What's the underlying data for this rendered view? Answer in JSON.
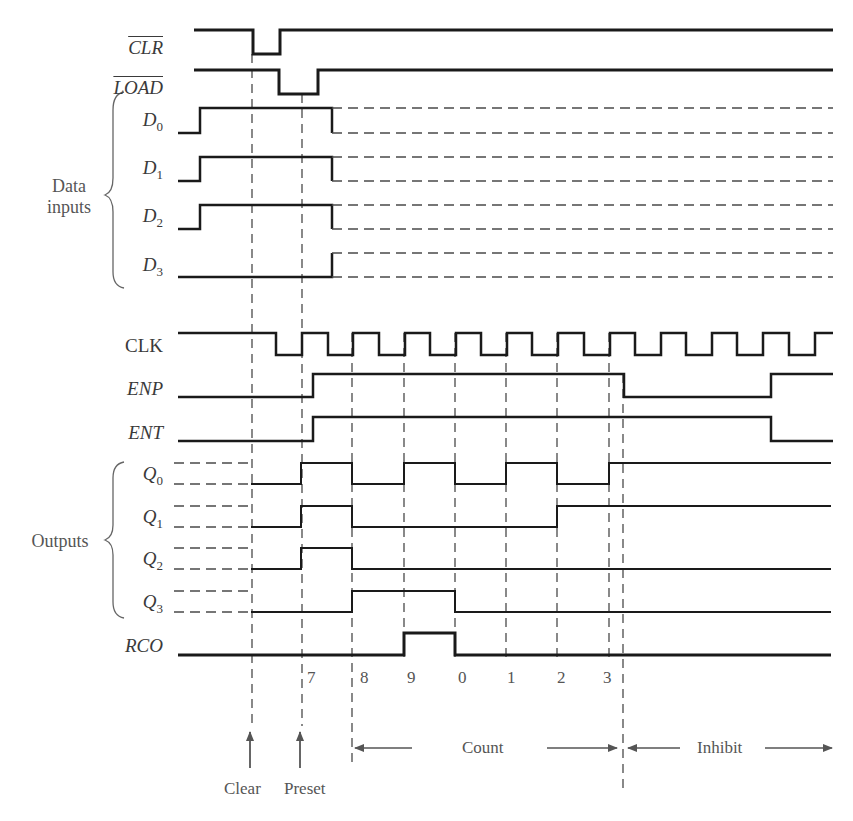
{
  "figure": {
    "type": "timing-diagram"
  },
  "groups": {
    "data_inputs": {
      "line1": "Data",
      "line2": "inputs"
    },
    "outputs": {
      "label": "Outputs"
    }
  },
  "signals": [
    {
      "id": "clr",
      "name": "CLR",
      "overline": true,
      "italic": true,
      "sub": "",
      "hi": 30,
      "lo": 54,
      "solid": [
        [
          194,
          "H"
        ],
        [
          253,
          "L"
        ],
        [
          280,
          "H"
        ],
        [
          833,
          "H"
        ]
      ],
      "dashed_after": null,
      "width": 3
    },
    {
      "id": "load",
      "name": "LOAD",
      "overline": true,
      "italic": true,
      "sub": "",
      "hi": 70,
      "lo": 94,
      "solid": [
        [
          194,
          "H"
        ],
        [
          279,
          "L"
        ],
        [
          318,
          "H"
        ],
        [
          833,
          "H"
        ]
      ],
      "dashed_after": null,
      "width": 3
    },
    {
      "id": "d0",
      "name": "D",
      "overline": false,
      "italic": true,
      "sub": "0",
      "hi": 108,
      "lo": 133,
      "solid": [
        [
          178,
          "L"
        ],
        [
          200,
          "H"
        ],
        [
          332,
          "L"
        ]
      ],
      "dashed_after": 332,
      "dashed_both": true,
      "width": 2.5
    },
    {
      "id": "d1",
      "name": "D",
      "overline": false,
      "italic": true,
      "sub": "1",
      "hi": 157,
      "lo": 181,
      "solid": [
        [
          178,
          "L"
        ],
        [
          200,
          "H"
        ],
        [
          332,
          "L"
        ]
      ],
      "dashed_after": 332,
      "dashed_both": true,
      "width": 2.5
    },
    {
      "id": "d2",
      "name": "D",
      "overline": false,
      "italic": true,
      "sub": "2",
      "hi": 205,
      "lo": 229,
      "solid": [
        [
          178,
          "L"
        ],
        [
          200,
          "H"
        ],
        [
          332,
          "L"
        ]
      ],
      "dashed_after": 332,
      "dashed_both": true,
      "width": 2.5
    },
    {
      "id": "d3",
      "name": "D",
      "overline": false,
      "italic": true,
      "sub": "3",
      "hi": 253,
      "lo": 277,
      "solid": [
        [
          178,
          "L"
        ],
        [
          332,
          "H"
        ]
      ],
      "dashed_after": 332,
      "dashed_both": true,
      "width": 2.5
    },
    {
      "id": "clk",
      "name": "CLK",
      "overline": false,
      "italic": false,
      "sub": "",
      "hi": 333,
      "lo": 355,
      "solid": [
        [
          178,
          "H"
        ],
        [
          276,
          "L"
        ],
        [
          302,
          "H"
        ],
        [
          328,
          "L"
        ],
        [
          353,
          "H"
        ],
        [
          379,
          "L"
        ],
        [
          405,
          "H"
        ],
        [
          430,
          "L"
        ],
        [
          456,
          "H"
        ],
        [
          481,
          "L"
        ],
        [
          507,
          "H"
        ],
        [
          532,
          "L"
        ],
        [
          558,
          "H"
        ],
        [
          584,
          "L"
        ],
        [
          610,
          "H"
        ],
        [
          635,
          "L"
        ],
        [
          661,
          "H"
        ],
        [
          686,
          "L"
        ],
        [
          712,
          "H"
        ],
        [
          737,
          "L"
        ],
        [
          763,
          "H"
        ],
        [
          789,
          "L"
        ],
        [
          815,
          "H"
        ],
        [
          833,
          "H"
        ]
      ],
      "dashed_after": null,
      "width": 2.5
    },
    {
      "id": "enp",
      "name": "ENP",
      "overline": false,
      "italic": true,
      "sub": "",
      "hi": 374,
      "lo": 397,
      "solid": [
        [
          178,
          "L"
        ],
        [
          313,
          "H"
        ],
        [
          624,
          "L"
        ],
        [
          771,
          "H"
        ],
        [
          833,
          "H"
        ]
      ],
      "dashed_after": null,
      "width": 2.5
    },
    {
      "id": "ent",
      "name": "ENT",
      "overline": false,
      "italic": true,
      "sub": "",
      "hi": 417,
      "lo": 441,
      "solid": [
        [
          178,
          "L"
        ],
        [
          313,
          "H"
        ],
        [
          771,
          "L"
        ],
        [
          833,
          "L"
        ]
      ],
      "dashed_after": null,
      "width": 2.5
    },
    {
      "id": "q0",
      "name": "Q",
      "overline": false,
      "italic": true,
      "sub": "0",
      "hi": 463,
      "lo": 484,
      "dashed_before": 251,
      "solid": [
        [
          251,
          "L"
        ],
        [
          301,
          "H"
        ],
        [
          352,
          "L"
        ],
        [
          404,
          "H"
        ],
        [
          455,
          "L"
        ],
        [
          506,
          "H"
        ],
        [
          557,
          "L"
        ],
        [
          609,
          "H"
        ],
        [
          831,
          "H"
        ]
      ],
      "width": 2
    },
    {
      "id": "q1",
      "name": "Q",
      "overline": false,
      "italic": true,
      "sub": "1",
      "hi": 506,
      "lo": 527,
      "dashed_before": 251,
      "solid": [
        [
          251,
          "L"
        ],
        [
          301,
          "H"
        ],
        [
          352,
          "L"
        ],
        [
          557,
          "H"
        ],
        [
          831,
          "H"
        ]
      ],
      "width": 2
    },
    {
      "id": "q2",
      "name": "Q",
      "overline": false,
      "italic": true,
      "sub": "2",
      "hi": 548,
      "lo": 569,
      "dashed_before": 251,
      "solid": [
        [
          251,
          "L"
        ],
        [
          301,
          "H"
        ],
        [
          352,
          "L"
        ],
        [
          831,
          "L"
        ]
      ],
      "width": 2
    },
    {
      "id": "q3",
      "name": "Q",
      "overline": false,
      "italic": true,
      "sub": "3",
      "hi": 591,
      "lo": 612,
      "dashed_before": 251,
      "solid": [
        [
          251,
          "L"
        ],
        [
          352,
          "H"
        ],
        [
          455,
          "L"
        ],
        [
          831,
          "L"
        ]
      ],
      "width": 2
    },
    {
      "id": "rco",
      "name": "RCO",
      "overline": false,
      "italic": true,
      "sub": "",
      "hi": 633,
      "lo": 655,
      "solid": [
        [
          178,
          "L"
        ],
        [
          404,
          "H"
        ],
        [
          455,
          "L"
        ],
        [
          831,
          "L"
        ]
      ],
      "width": 3
    }
  ],
  "label_positions": {
    "clr": {
      "right": 163,
      "y": 38
    },
    "load": {
      "right": 163,
      "y": 78
    },
    "d0": {
      "right": 163,
      "y": 110
    },
    "d1": {
      "right": 163,
      "y": 158
    },
    "d2": {
      "right": 163,
      "y": 206
    },
    "d3": {
      "right": 163,
      "y": 255
    },
    "clk": {
      "right": 163,
      "y": 336
    },
    "enp": {
      "right": 163,
      "y": 379
    },
    "ent": {
      "right": 163,
      "y": 423
    },
    "q0": {
      "right": 163,
      "y": 464
    },
    "q1": {
      "right": 163,
      "y": 507
    },
    "q2": {
      "right": 163,
      "y": 549
    },
    "q3": {
      "right": 163,
      "y": 592
    },
    "rco": {
      "right": 163,
      "y": 636
    }
  },
  "markers": {
    "vertical_dashes": [
      {
        "x": 252,
        "y1": 54,
        "y2": 726
      },
      {
        "x": 302,
        "y1": 94,
        "y2": 726
      },
      {
        "x": 352,
        "y1": 333,
        "y2": 768
      },
      {
        "x": 404,
        "y1": 333,
        "y2": 660
      },
      {
        "x": 455,
        "y1": 333,
        "y2": 660
      },
      {
        "x": 506,
        "y1": 333,
        "y2": 660
      },
      {
        "x": 557,
        "y1": 333,
        "y2": 660
      },
      {
        "x": 609,
        "y1": 333,
        "y2": 660
      },
      {
        "x": 623,
        "y1": 374,
        "y2": 790
      }
    ],
    "count_values": [
      {
        "label": "7",
        "x": 307
      },
      {
        "label": "8",
        "x": 360
      },
      {
        "label": "9",
        "x": 407
      },
      {
        "label": "0",
        "x": 458
      },
      {
        "label": "1",
        "x": 507
      },
      {
        "label": "2",
        "x": 557
      },
      {
        "label": "3",
        "x": 603
      }
    ],
    "count_values_y": 668
  },
  "annotations": {
    "clear": {
      "label": "Clear",
      "x": 250
    },
    "preset": {
      "label": "Preset",
      "x": 300
    },
    "count": {
      "label": "Count",
      "x1": 352,
      "x2": 622,
      "y": 748
    },
    "inhibit": {
      "label": "Inhibit",
      "x1": 625,
      "x2": 832,
      "y": 748
    }
  },
  "colors": {
    "signal": "#1a1a1a",
    "dashed": "#4a4a4a",
    "text": "#3a3a3a"
  }
}
